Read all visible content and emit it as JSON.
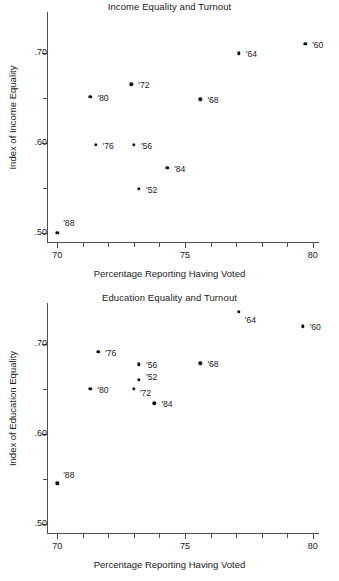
{
  "figure": {
    "width": 339,
    "height": 581,
    "background": "#ffffff",
    "marker_color": "#111111",
    "axis_color": "#4d4d4d"
  },
  "chart_data": [
    {
      "type": "scatter",
      "title": "Income Equality and Turnout",
      "xlabel": "Percentage Reporting Having Voted",
      "ylabel": "Index of Income Equality",
      "xlim": [
        69.6,
        80.2
      ],
      "ylim": [
        0.49,
        0.745
      ],
      "grid": false,
      "legend": "none",
      "x_ticks_major": [
        70,
        75,
        80
      ],
      "x_ticks_major_labels": [
        "70",
        "75",
        "80"
      ],
      "x_ticks_minor": [
        71,
        72,
        73,
        74,
        76,
        77,
        78,
        79
      ],
      "y_ticks_major": [
        0.5,
        0.6,
        0.7
      ],
      "y_ticks_major_labels": [
        ".50",
        ".60",
        ".70"
      ],
      "y_ticks_minor": [
        0.55,
        0.65
      ],
      "points": [
        {
          "label": "'88",
          "x": 70.0,
          "y": 0.5,
          "label_dx": 6,
          "label_dy": -10
        },
        {
          "label": "'80",
          "x": 71.3,
          "y": 0.651,
          "label_dx": 7,
          "label_dy": 1
        },
        {
          "label": "'76",
          "x": 71.5,
          "y": 0.598,
          "label_dx": 7,
          "label_dy": 1
        },
        {
          "label": "'72",
          "x": 72.9,
          "y": 0.665,
          "label_dx": 7,
          "label_dy": 1
        },
        {
          "label": "'56",
          "x": 73.0,
          "y": 0.598,
          "label_dx": 7,
          "label_dy": 1
        },
        {
          "label": "'52",
          "x": 73.2,
          "y": 0.549,
          "label_dx": 7,
          "label_dy": 1
        },
        {
          "label": "'84",
          "x": 74.3,
          "y": 0.572,
          "label_dx": 7,
          "label_dy": 1
        },
        {
          "label": "'68",
          "x": 75.6,
          "y": 0.648,
          "label_dx": 7,
          "label_dy": 1
        },
        {
          "label": "'64",
          "x": 77.1,
          "y": 0.699,
          "label_dx": 7,
          "label_dy": 1
        },
        {
          "label": "'60",
          "x": 79.7,
          "y": 0.71,
          "label_dx": 7,
          "label_dy": 1
        }
      ]
    },
    {
      "type": "scatter",
      "title": "Education Equality and Turnout",
      "xlabel": "Percentage Reporting Having Voted",
      "ylabel": "Index of Education Equality",
      "xlim": [
        69.6,
        80.2
      ],
      "ylim": [
        0.49,
        0.745
      ],
      "grid": false,
      "legend": "none",
      "x_ticks_major": [
        70,
        75,
        80
      ],
      "x_ticks_major_labels": [
        "70",
        "75",
        "80"
      ],
      "x_ticks_minor": [
        71,
        72,
        73,
        74,
        76,
        77,
        78,
        79
      ],
      "y_ticks_major": [
        0.5,
        0.6,
        0.7
      ],
      "y_ticks_major_labels": [
        ".50",
        ".60",
        ".70"
      ],
      "y_ticks_minor": [
        0.55,
        0.65
      ],
      "points": [
        {
          "label": "'88",
          "x": 70.0,
          "y": 0.545,
          "label_dx": 6,
          "label_dy": -8
        },
        {
          "label": "'80",
          "x": 71.3,
          "y": 0.65,
          "label_dx": 7,
          "label_dy": 1
        },
        {
          "label": "'76",
          "x": 71.6,
          "y": 0.691,
          "label_dx": 7,
          "label_dy": 1
        },
        {
          "label": "'72",
          "x": 73.0,
          "y": 0.65,
          "label_dx": 6,
          "label_dy": 4
        },
        {
          "label": "'52",
          "x": 73.2,
          "y": 0.66,
          "label_dx": 7,
          "label_dy": -3
        },
        {
          "label": "'56",
          "x": 73.2,
          "y": 0.677,
          "label_dx": 7,
          "label_dy": 1
        },
        {
          "label": "'84",
          "x": 73.8,
          "y": 0.634,
          "label_dx": 7,
          "label_dy": 1
        },
        {
          "label": "'68",
          "x": 75.6,
          "y": 0.678,
          "label_dx": 7,
          "label_dy": 1
        },
        {
          "label": "'64",
          "x": 77.1,
          "y": 0.735,
          "label_dx": 6,
          "label_dy": 8
        },
        {
          "label": "'60",
          "x": 79.6,
          "y": 0.719,
          "label_dx": 7,
          "label_dy": 1
        }
      ]
    }
  ]
}
